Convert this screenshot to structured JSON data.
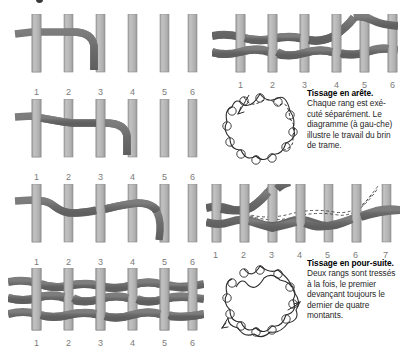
{
  "figure": {
    "title_fragment_visible": "",
    "post_labels_6": [
      "1",
      "2",
      "3",
      "4",
      "5",
      "6"
    ],
    "post_labels_7": [
      "1",
      "2",
      "3",
      "4",
      "5",
      "6",
      "7"
    ]
  },
  "colors": {
    "post_fill": "#b4b4b4",
    "post_edge": "#8e8e8e",
    "strand_fill": "#6e6e6e",
    "strand_edge": "#5a5a5a",
    "label_text": "#7a7a7a",
    "line_ink": "#2b2b2b",
    "background": "#ffffff"
  },
  "panels": {
    "left_row1": {
      "name": "step-1-weave",
      "posts": 6,
      "labels": [
        "1",
        "2",
        "3",
        "4",
        "5",
        "6"
      ]
    },
    "left_row2": {
      "name": "step-2-weave",
      "posts": 6,
      "labels": [
        "1",
        "2",
        "3",
        "4",
        "5",
        "6"
      ]
    },
    "left_row3": {
      "name": "step-3-weave",
      "posts": 6,
      "labels": [
        "1",
        "2",
        "3",
        "4",
        "5",
        "6"
      ]
    },
    "left_row4": {
      "name": "finished-weave",
      "posts": 6,
      "labels": [
        "1",
        "2",
        "3",
        "4",
        "5",
        "6"
      ]
    },
    "right_row1": {
      "name": "arete-weave",
      "posts": 6,
      "labels": [
        "1",
        "2",
        "3",
        "4",
        "5",
        "6"
      ]
    },
    "right_row3": {
      "name": "poursuite-weave",
      "posts": 7,
      "labels": [
        "1",
        "2",
        "3",
        "4",
        "5",
        "6",
        "7"
      ]
    },
    "circle_top": {
      "name": "arete-circular-diagram",
      "stakes": 12
    },
    "circle_bottom": {
      "name": "poursuite-circular-diagram",
      "stakes": 12
    }
  },
  "captions": {
    "arete": {
      "heading": "Tissage en arête.",
      "body": " Chaque rang est exé-cuté séparément. Le diagramme (à gau-che) illustre le travail du brin de trame."
    },
    "poursuite": {
      "heading": "Tissage en pour-suite.",
      "body": " Deux rangs sont tressés à la fois, le premier devançant toujours le dernier de quatre montants."
    }
  }
}
